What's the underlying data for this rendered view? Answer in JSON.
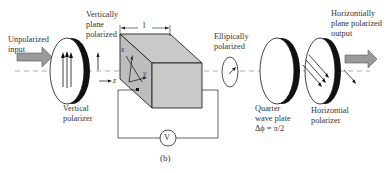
{
  "figure": {
    "caption": "(b)",
    "labels": {
      "unpolarized_input": "Unpolarized\ninput",
      "vertical_polarizer": "Vertical\npolarizer",
      "vertically_plane_polarized": "Vertically\nplane\npolarized",
      "length": "l",
      "axis_x": "x",
      "axis_y": "y",
      "axis_z": "z",
      "ellipically_polarized": "Ellipically\npolarized",
      "quarter_wave_plate": "Quarter\nwave plate\nΔϕ = π/2",
      "horizontial_polarizer": "Horizontial\npolarizer",
      "horizontially_plane_polarized_output": "Horizontially\nplane polarized\noutput",
      "voltmeter": "V"
    },
    "colors": {
      "crystal_fill": "#c9c9c9",
      "arrow_fill": "#9a9a9a",
      "line": "#222222",
      "dashed_axis": "#999999"
    }
  }
}
